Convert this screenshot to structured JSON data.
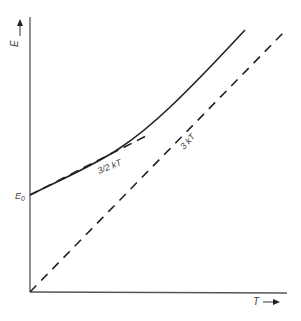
{
  "diagram": {
    "y_axis_label": "E",
    "x_axis_label": "T",
    "e0_label": "E",
    "e0_subscript": "0",
    "curves": [
      {
        "name": "total-energy",
        "style": "solid",
        "label": ""
      },
      {
        "name": "three-halves-kT",
        "style": "dashed",
        "label": "3/2 kT"
      },
      {
        "name": "three-kT",
        "style": "dashed",
        "label": "3 kT"
      }
    ],
    "colors": {
      "line": "#222222",
      "axis": "#555555",
      "text": "#444444"
    }
  }
}
